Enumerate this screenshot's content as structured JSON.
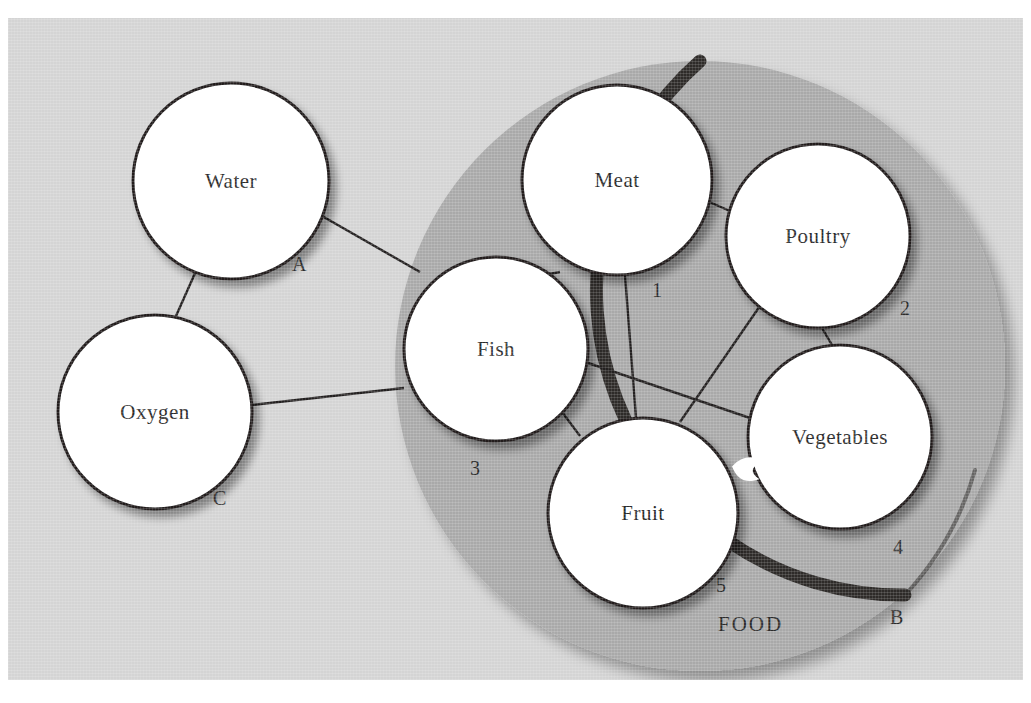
{
  "diagram": {
    "region": {
      "name": "food-region",
      "label": "FOOD",
      "boundary_mark": "B",
      "fill_color": "#a9a9a9",
      "stroke_color": "#2e2b29"
    },
    "background_color": "#d4d4d4",
    "node_fill_color": "#ffffff",
    "node_stroke_color": "#221f1f",
    "edge_color": "#232020"
  },
  "nodes": [
    {
      "id": "water",
      "label": "Water",
      "mark": "A",
      "inside_food": false,
      "cx": 231,
      "cy": 181,
      "r": 98,
      "mark_x": 292,
      "mark_y": 253
    },
    {
      "id": "oxygen",
      "label": "Oxygen",
      "mark": "C",
      "inside_food": false,
      "cx": 155,
      "cy": 412,
      "r": 97,
      "mark_x": 213,
      "mark_y": 487
    },
    {
      "id": "meat",
      "label": "Meat",
      "mark": "1",
      "inside_food": true,
      "cx": 617,
      "cy": 180,
      "r": 95,
      "mark_x": 652,
      "mark_y": 279
    },
    {
      "id": "poultry",
      "label": "Poultry",
      "mark": "2",
      "inside_food": true,
      "cx": 818,
      "cy": 236,
      "r": 92,
      "mark_x": 900,
      "mark_y": 297
    },
    {
      "id": "fish",
      "label": "Fish",
      "mark": "3",
      "inside_food": true,
      "cx": 496,
      "cy": 349,
      "r": 92,
      "mark_x": 470,
      "mark_y": 457
    },
    {
      "id": "vegetables",
      "label": "Vegetables",
      "mark": "4",
      "inside_food": true,
      "cx": 840,
      "cy": 437,
      "r": 92,
      "mark_x": 893,
      "mark_y": 536
    },
    {
      "id": "fruit",
      "label": "Fruit",
      "mark": "5",
      "inside_food": true,
      "cx": 643,
      "cy": 513,
      "r": 95,
      "mark_x": 716,
      "mark_y": 574
    }
  ],
  "edges": [
    {
      "id": "water-food",
      "from": "water",
      "to": "food-boundary"
    },
    {
      "id": "water-oxygen",
      "from": "water",
      "to": "oxygen"
    },
    {
      "id": "oxygen-food",
      "from": "oxygen",
      "to": "food-boundary"
    },
    {
      "id": "meat-poultry",
      "from": "meat",
      "to": "poultry"
    },
    {
      "id": "meat-fish",
      "from": "meat",
      "to": "fish"
    },
    {
      "id": "meat-fruit",
      "from": "meat",
      "to": "fruit"
    },
    {
      "id": "fish-vegetables",
      "from": "fish",
      "to": "vegetables"
    },
    {
      "id": "fish-fruit",
      "from": "fish",
      "to": "fruit"
    },
    {
      "id": "poultry-vegetables",
      "from": "poultry",
      "to": "vegetables"
    },
    {
      "id": "poultry-fruit",
      "from": "poultry",
      "to": "fruit"
    },
    {
      "id": "fruit-vegetables",
      "from": "fruit",
      "to": "vegetables"
    }
  ],
  "food_region_geometry": {
    "cx": 700,
    "cy": 366,
    "r": 305,
    "label_x": 718,
    "label_y": 612,
    "mark_x": 890,
    "mark_y": 606
  }
}
